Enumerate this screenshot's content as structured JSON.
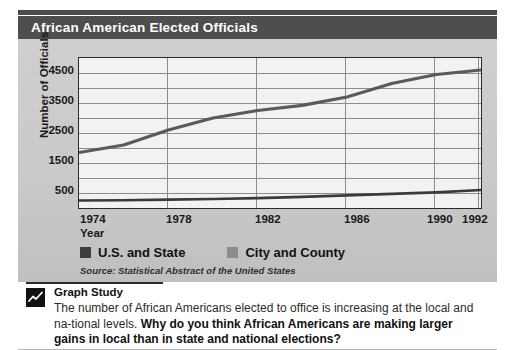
{
  "figure": {
    "title": "African American Elected Officials",
    "source": "Source: Statistical Abstract of the United States"
  },
  "caption": {
    "heading": "Graph Study",
    "icon": "line-chart-icon",
    "text_plain_1": "The number of African Americans elected to office is increasing at the local and na-tional levels. ",
    "text_bold": "Why do you think African Americans are making larger gains in local than in state and national elections?"
  },
  "colors": {
    "title_bar": "#4e4e4e",
    "panel": "#c9c9c9",
    "plot_background": "#f2f2f2",
    "gridline": "#8d8d8d",
    "axis": "#2b2b2b",
    "series_city_county": "#5a5a5a",
    "series_us_state": "#3a3a3a"
  },
  "chart_data": {
    "type": "line",
    "title": "African American Elected Officials",
    "xlabel": "Year",
    "ylabel": "Number of Officials",
    "xlim": [
      1974,
      1992
    ],
    "ylim": [
      0,
      5000
    ],
    "xticks": [
      1974,
      1978,
      1982,
      1986,
      1990,
      1992
    ],
    "yticks": [
      500,
      1500,
      2500,
      3500,
      4500
    ],
    "ytick_labels": [
      "500",
      "1500",
      "2500",
      "3500",
      "4500"
    ],
    "gridlines_y": [
      500,
      1000,
      1500,
      2000,
      2500,
      3000,
      3500,
      4000,
      4500,
      5000
    ],
    "gridlines_x": [
      1978,
      1982,
      1986,
      1990,
      1992
    ],
    "grid": true,
    "legend_position": "below-axes",
    "source": "Source: Statistical Abstract of the United States",
    "x": [
      1974,
      1976,
      1978,
      1980,
      1982,
      1984,
      1986,
      1988,
      1990,
      1992
    ],
    "series": [
      {
        "name": "City and County",
        "color": "#5a5a5a",
        "values": [
          1850,
          2100,
          2600,
          3000,
          3250,
          3420,
          3700,
          4150,
          4450,
          4600
        ]
      },
      {
        "name": "U.S. and State",
        "color": "#3a3a3a",
        "values": [
          250,
          260,
          280,
          300,
          330,
          370,
          420,
          470,
          520,
          600
        ]
      }
    ]
  },
  "legend": [
    {
      "label": "U.S. and State",
      "color": "#3f3f3f"
    },
    {
      "label": "City and County",
      "color": "#8c8c8c"
    }
  ]
}
